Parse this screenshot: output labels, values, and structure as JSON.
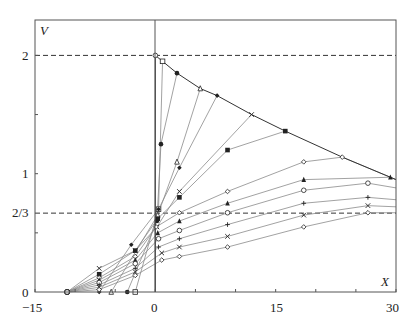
{
  "chart_data": {
    "type": "line",
    "title": "",
    "xlabel": "X",
    "ylabel": "V",
    "xlim": [
      -15,
      30
    ],
    "ylim": [
      0,
      2.3
    ],
    "x_ticks": [
      -15,
      0,
      15,
      30
    ],
    "x_tick_labels": [
      "−15",
      "0",
      "15",
      "30"
    ],
    "x_minor_ticks": [
      -10,
      -5,
      5,
      10,
      20,
      25
    ],
    "y_ticks": [
      0,
      1,
      2
    ],
    "y_tick_labels": [
      "0",
      "1",
      "2"
    ],
    "y_extra_labels": [
      {
        "value": 0.6667,
        "label": "2/3"
      }
    ],
    "reference_lines": [
      {
        "y": 2,
        "style": "dashed"
      },
      {
        "y": 0.6667,
        "style": "dashed"
      }
    ],
    "grid": false,
    "envelope": {
      "name": "upper envelope",
      "x": [
        0,
        0.9,
        2.7,
        5.6,
        7.7,
        12,
        16.2,
        23.3,
        29.3,
        30
      ],
      "y": [
        2,
        1.95,
        1.85,
        1.72,
        1.66,
        1.5,
        1.36,
        1.14,
        0.97,
        0.95
      ]
    },
    "series": [
      {
        "name": "s1",
        "marker": "open-square",
        "x": [
          -2.5,
          0.4,
          0.9
        ],
        "y": [
          0,
          0.7,
          1.95
        ]
      },
      {
        "name": "s2",
        "marker": "filled-circle",
        "x": [
          -3.5,
          0.2,
          0.7,
          2.7
        ],
        "y": [
          0,
          0.6,
          1.25,
          1.85
        ]
      },
      {
        "name": "s3",
        "marker": "open-triangle",
        "x": [
          -5.5,
          0.3,
          2.7,
          5.6
        ],
        "y": [
          0,
          0.65,
          1.1,
          1.72
        ]
      },
      {
        "name": "s4",
        "marker": "filled-diamond",
        "x": [
          -7,
          -3,
          0.4,
          3,
          7.7
        ],
        "y": [
          0,
          0.4,
          0.7,
          1.05,
          1.66
        ]
      },
      {
        "name": "s5",
        "marker": "cross",
        "x": [
          -11,
          -7,
          -2.5,
          0.2,
          3,
          12
        ],
        "y": [
          0,
          0.2,
          0.35,
          0.55,
          0.85,
          1.5
        ]
      },
      {
        "name": "s6",
        "marker": "filled-square",
        "x": [
          -11,
          -7,
          -2.5,
          0.3,
          3,
          9,
          16.2
        ],
        "y": [
          0,
          0.15,
          0.35,
          0.62,
          0.8,
          1.2,
          1.36
        ]
      },
      {
        "name": "s7",
        "marker": "open-diamond",
        "x": [
          -11,
          -7,
          -2.5,
          0.1,
          3,
          9,
          18.5,
          23.3,
          30
        ],
        "y": [
          0,
          0.12,
          0.3,
          0.55,
          0.67,
          0.85,
          1.1,
          1.14,
          0.95
        ]
      },
      {
        "name": "s8",
        "marker": "filled-triangle",
        "x": [
          -11,
          -7,
          -2.5,
          0.3,
          3,
          9,
          18.5,
          29.3,
          30
        ],
        "y": [
          0,
          0.1,
          0.27,
          0.5,
          0.6,
          0.75,
          0.95,
          0.97,
          0.95
        ]
      },
      {
        "name": "s9",
        "marker": "open-circle",
        "x": [
          -11,
          -7,
          -2.5,
          0.4,
          3,
          9,
          18.5,
          26.5,
          30
        ],
        "y": [
          0,
          0.08,
          0.24,
          0.45,
          0.52,
          0.67,
          0.86,
          0.92,
          0.88
        ]
      },
      {
        "name": "s10",
        "marker": "plus",
        "x": [
          -11,
          -7,
          -2.5,
          0.4,
          3,
          9,
          18.5,
          26.5,
          30
        ],
        "y": [
          0,
          0.06,
          0.2,
          0.38,
          0.45,
          0.57,
          0.75,
          0.8,
          0.78
        ]
      },
      {
        "name": "s11",
        "marker": "x",
        "x": [
          -11,
          -7,
          -2.5,
          0.8,
          3,
          9,
          18.5,
          26.5,
          30
        ],
        "y": [
          0,
          0.04,
          0.17,
          0.33,
          0.38,
          0.47,
          0.65,
          0.73,
          0.72
        ]
      },
      {
        "name": "s12",
        "marker": "open-diamond-small",
        "x": [
          -11,
          -7,
          -2.5,
          0.8,
          3,
          9,
          18.5,
          26.5,
          30
        ],
        "y": [
          0,
          0.02,
          0.14,
          0.27,
          0.3,
          0.38,
          0.55,
          0.67,
          0.67
        ]
      }
    ],
    "colors": {
      "axis": "#555555",
      "line": "#8a8a8a",
      "envelope": "#333333",
      "marker": "#222222",
      "dashed": "#333333"
    }
  },
  "labels": {
    "y_axis_title": "V",
    "x_axis_title": "X",
    "y_2": "2",
    "y_1": "1",
    "y_23": "2/3",
    "y_0": "0",
    "x_m15": "−15",
    "x_0": "0",
    "x_15": "15",
    "x_30": "30"
  }
}
